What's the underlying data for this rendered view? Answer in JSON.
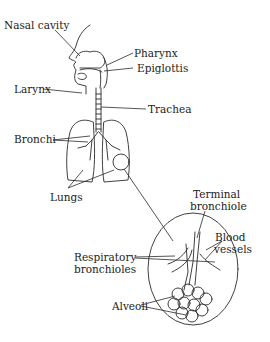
{
  "figure": {
    "labels": {
      "nasal_cavity": "Nasal cavity",
      "pharynx": "Pharynx",
      "epiglottis": "Epiglottis",
      "larynx": "Larynx",
      "trachea": "Trachea",
      "bronchi": "Bronchi",
      "lungs": "Lungs",
      "terminal_bronchiole_1": "Terminal",
      "terminal_bronchiole_2": "bronchiole",
      "blood_vessels_1": "Blood",
      "blood_vessels_2": "vessels",
      "respiratory_bronchioles_1": "Respiratory",
      "respiratory_bronchioles_2": "bronchioles",
      "alveoli": "Alveoli"
    }
  }
}
